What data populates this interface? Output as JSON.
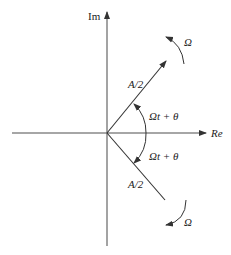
{
  "diagram": {
    "type": "phasor diagram (complex plane)",
    "axes": {
      "vertical_label": "Im",
      "horizontal_label": "Re"
    },
    "phasors": [
      {
        "name": "upper-phasor",
        "magnitude_label": "A/2",
        "angle_label": "Ωt + θ",
        "rotation_label": "Ω",
        "rotation": "counter-clockwise"
      },
      {
        "name": "lower-phasor",
        "magnitude_label": "A/2",
        "angle_label": "Ωt + θ",
        "rotation_label": "Ω",
        "rotation": "clockwise"
      }
    ],
    "colors": {
      "axis": "#777777",
      "line": "#333333",
      "background": "#ffffff"
    }
  }
}
